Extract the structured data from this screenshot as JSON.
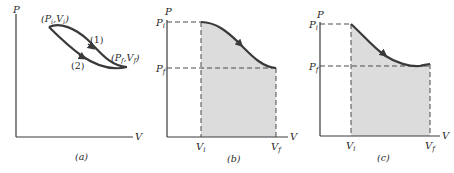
{
  "panels": [
    {
      "id": "a",
      "caption": "(a)",
      "axis_p": "P",
      "axis_v": "V",
      "point_initial": "(P",
      "point_initial_sub": "i",
      "point_initial_v": ",V",
      "point_initial_vsub": "i",
      "point_final": "(P",
      "point_final_sub": "f",
      "point_final_v": ",V",
      "point_final_vsub": "f",
      "path1_label": "(1)",
      "path2_label": "(2)"
    },
    {
      "id": "b",
      "caption": "(b)",
      "axis_p": "P",
      "axis_v": "V",
      "p_initial": "P",
      "p_initial_sub": "i",
      "p_final": "P",
      "p_final_sub": "f",
      "v_initial": "V",
      "v_initial_sub": "i",
      "v_final": "V",
      "v_final_sub": "f"
    },
    {
      "id": "c",
      "caption": "(c)",
      "axis_p": "P",
      "axis_v": "V",
      "p_initial": "P",
      "p_initial_sub": "i",
      "p_final": "P",
      "p_final_sub": "f",
      "v_initial": "V",
      "v_initial_sub": "i",
      "v_final": "V",
      "v_final_sub": "f"
    }
  ],
  "colors": {
    "line": "#3a3a3a",
    "curve": "#4a4a4a",
    "shade": "#dcdcdc",
    "dash": "#4a4a4a"
  }
}
